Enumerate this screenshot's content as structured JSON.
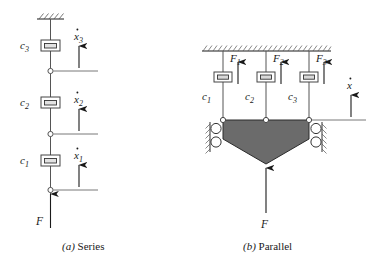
{
  "figure": {
    "background": "#ffffff",
    "ink": "#1a1a1a",
    "mass_fill": "#6b6b6b",
    "mass_stroke": "#2b2b2b"
  },
  "panels": [
    {
      "id": "series",
      "caption_letter": "(a)",
      "caption_text": "Series",
      "support": "fixed-hatched-ceiling",
      "dampers": [
        {
          "label": "c",
          "subscript": "3"
        },
        {
          "label": "c",
          "subscript": "2"
        },
        {
          "label": "c",
          "subscript": "1"
        }
      ],
      "velocities": [
        {
          "symbol": "x",
          "subscript": "3",
          "overdot": true
        },
        {
          "symbol": "x",
          "subscript": "2",
          "overdot": true
        },
        {
          "symbol": "x",
          "subscript": "1",
          "overdot": true
        }
      ],
      "applied_force": {
        "label": "F",
        "direction": "up"
      }
    },
    {
      "id": "parallel",
      "caption_letter": "(b)",
      "caption_text": "Parallel",
      "support": "fixed-hatched-ceiling",
      "dampers": [
        {
          "label": "c",
          "subscript": "1"
        },
        {
          "label": "c",
          "subscript": "2"
        },
        {
          "label": "c",
          "subscript": "3"
        }
      ],
      "damper_forces": [
        {
          "symbol": "F",
          "subscript": "1",
          "direction": "up"
        },
        {
          "symbol": "F",
          "subscript": "2",
          "direction": "up"
        },
        {
          "symbol": "F",
          "subscript": "3",
          "direction": "up"
        }
      ],
      "velocity": {
        "symbol": "x",
        "subscript": "",
        "overdot": true
      },
      "applied_force": {
        "label": "F",
        "direction": "up"
      },
      "mass_shape": "pentagon",
      "guides": {
        "left_rollers": 2,
        "right_rollers": 2
      }
    }
  ]
}
